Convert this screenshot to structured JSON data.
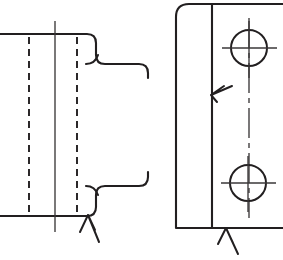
{
  "document": {
    "kind": "engineering-line-drawing",
    "title": "Machined Bracket — Two-View Orthographic Drawing",
    "background_color": "#ffffff",
    "line_color": "#221f20",
    "centerline_color": "#3a3738",
    "canvas": {
      "width": 283,
      "height": 260
    }
  },
  "views": {
    "left_view": {
      "name": "Side Elevation (sectioned / partial)",
      "label": "left-side-view",
      "body": {
        "top_edge_y": 34,
        "bottom_edge_y": 216,
        "left_edge_x": 0,
        "right_edge_x": 96
      },
      "hidden_edges": [
        {
          "name": "hidden-edge-left",
          "x": 29,
          "y1": 38,
          "y2": 213
        },
        {
          "name": "hidden-edge-right",
          "x": 77,
          "y1": 38,
          "y2": 213
        }
      ],
      "center_line": {
        "name": "vertical-center-line",
        "x": 55,
        "y1": 21,
        "y2": 232
      },
      "neck": {
        "top_shoulder_y": 64,
        "bottom_shoulder_y": 186,
        "right_x": 148,
        "corner_radius": 9
      }
    },
    "right_view": {
      "name": "Front Elevation",
      "label": "right-front-view",
      "block": {
        "left_edge_x": 176,
        "right_edge_x": 283,
        "top_edge_y": 4,
        "bottom_edge_y": 228,
        "corner_radius": 13
      },
      "inner_vertical_line": {
        "name": "flange-face-line",
        "x": 212,
        "y1": 4,
        "y2": 228
      },
      "center_line_vertical": {
        "name": "hole-axis-centerline",
        "x": 249,
        "y1": 18,
        "y2": 218
      },
      "holes": [
        {
          "name": "upper-hole",
          "cx": 249,
          "cy": 48,
          "r": 18,
          "centermark_h": {
            "x1": 222,
            "x2": 277,
            "y": 48
          },
          "centermark_v": {
            "y1": 21,
            "y2": 78,
            "x": 249
          }
        },
        {
          "name": "lower-hole",
          "cx": 248,
          "cy": 183,
          "r": 18,
          "centermark_h": {
            "x1": 221,
            "x2": 276,
            "y": 183
          },
          "centermark_v": {
            "y1": 156,
            "y2": 212,
            "x": 248
          }
        }
      ]
    }
  },
  "annotations": {
    "leaders": [
      {
        "name": "surface-finish-leader-flange-face",
        "description": "Arrow pointing left to the flange face line inside the front view",
        "tip": {
          "x": 211,
          "y": 95
        },
        "tail": {
          "x": 232,
          "y": 86
        },
        "barb_a": {
          "x": 224,
          "y": 86
        },
        "barb_b": {
          "x": 217,
          "y": 102
        }
      },
      {
        "name": "surface-finish-leader-block-bottom",
        "description": "Arrow pointing up to the bottom edge of the front view block",
        "tip": {
          "x": 226,
          "y": 228
        },
        "tail": {
          "x": 238,
          "y": 254
        },
        "barb_a": {
          "x": 218,
          "y": 244
        },
        "barb_b": {
          "x": 232,
          "y": 241
        }
      },
      {
        "name": "surface-finish-leader-side-bottom",
        "description": "Arrow pointing up to the bottom edge of the side view",
        "tip": {
          "x": 88,
          "y": 215
        },
        "tail": {
          "x": 99,
          "y": 242
        },
        "barb_a": {
          "x": 80,
          "y": 232
        },
        "barb_b": {
          "x": 94,
          "y": 229
        }
      }
    ]
  }
}
